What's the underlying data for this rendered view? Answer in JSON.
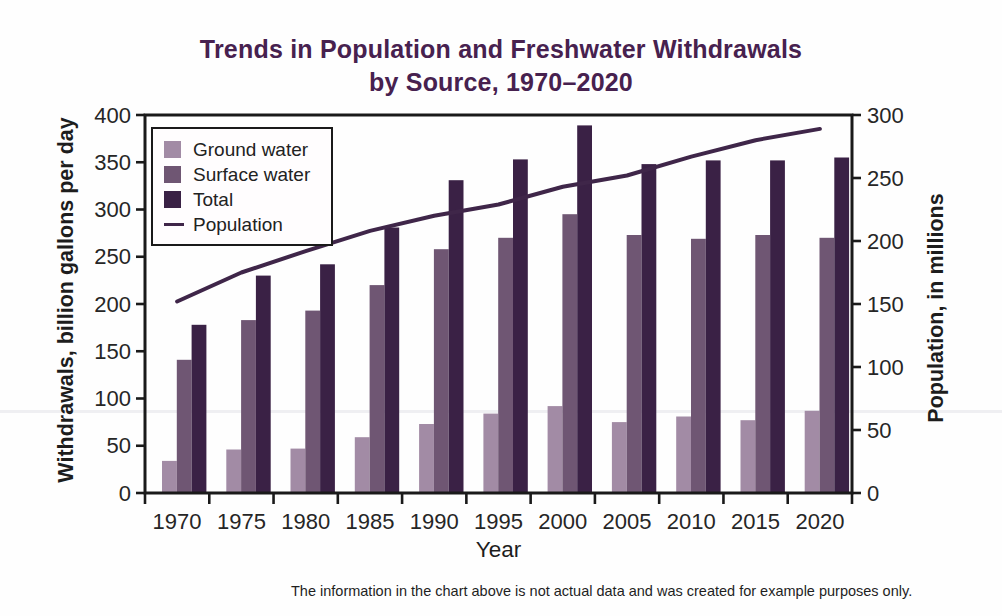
{
  "title": {
    "line1": "Trends in Population and Freshwater Withdrawals",
    "line2": "by Source, 1970–2020"
  },
  "caption": "The information in the chart above is not actual data and was created for example purposes only.",
  "colors": {
    "title": "#47214f",
    "ground_water": "#a28ba5",
    "surface_water": "#6f5673",
    "total": "#3a2145",
    "population_line": "#3f2649",
    "axis": "#1a1a1a",
    "tick_text": "#262626"
  },
  "chart_data": {
    "type": "bar",
    "subtype": "grouped bars with overlaid line (dual axis)",
    "title": "Trends in Population and Freshwater Withdrawals by Source, 1970–2020",
    "xlabel": "Year",
    "ylabel_left": "Withdrawals, billion gallons per day",
    "ylabel_right": "Population, in millions",
    "ylim_left": [
      0,
      400
    ],
    "ylim_right": [
      0,
      300
    ],
    "yticks_left": [
      0,
      50,
      100,
      150,
      200,
      250,
      300,
      350,
      400
    ],
    "yticks_right": [
      0,
      50,
      100,
      150,
      200,
      250,
      300
    ],
    "grid": "off",
    "legend_position": "upper-left",
    "categories": [
      "1970",
      "1975",
      "1980",
      "1985",
      "1990",
      "1995",
      "2000",
      "2005",
      "2010",
      "2015",
      "2020"
    ],
    "series": [
      {
        "name": "Ground water",
        "kind": "bar",
        "axis": "left",
        "color": "#a28ba5",
        "values": [
          34,
          46,
          47,
          59,
          73,
          84,
          92,
          75,
          81,
          77,
          87
        ]
      },
      {
        "name": "Surface water",
        "kind": "bar",
        "axis": "left",
        "color": "#6f5673",
        "values": [
          141,
          183,
          193,
          220,
          258,
          270,
          295,
          273,
          269,
          273,
          270
        ]
      },
      {
        "name": "Total",
        "kind": "bar",
        "axis": "left",
        "color": "#3a2145",
        "values": [
          178,
          230,
          242,
          281,
          331,
          353,
          389,
          348,
          352,
          352,
          355
        ]
      },
      {
        "name": "Population",
        "kind": "line",
        "axis": "right",
        "color": "#3f2649",
        "values": [
          152,
          175,
          192,
          208,
          220,
          229,
          243,
          252,
          267,
          280,
          289
        ]
      }
    ]
  }
}
